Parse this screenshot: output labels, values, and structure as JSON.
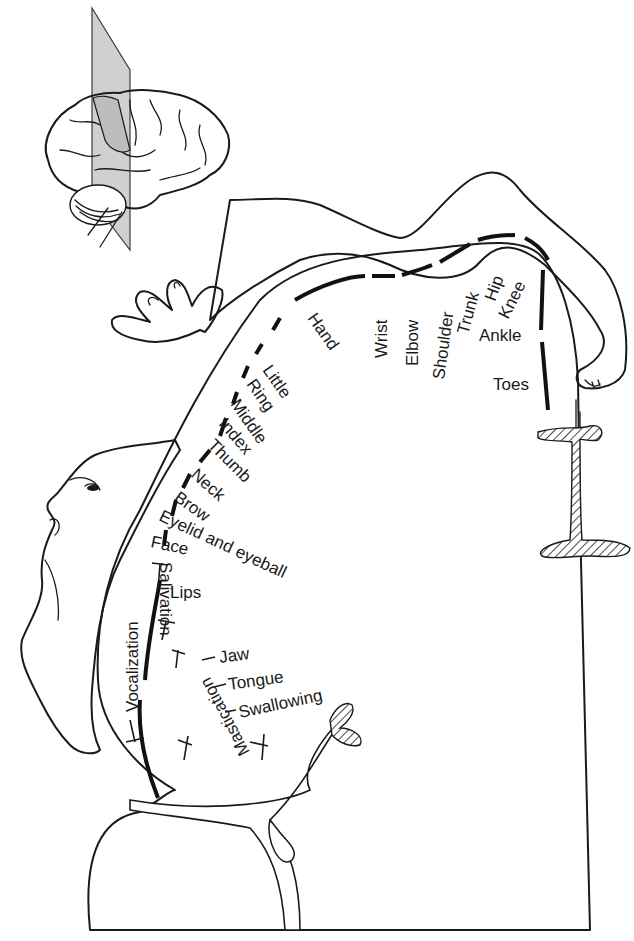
{
  "figure": {
    "colors": {
      "cortex_fill": "#e6e6e6",
      "body_fill": "#e2e2e2",
      "ink": "#1a1a1a",
      "plane": "#b5b5b5",
      "background": "#ffffff"
    },
    "inset": {
      "name": "brain-lateral-view-with-section-plane"
    },
    "labels": {
      "hand": "Hand",
      "wrist": "Wrist",
      "elbow": "Elbow",
      "shoulder": "Shoulder",
      "trunk": "Trunk",
      "hip": "Hip",
      "knee": "Knee",
      "ankle": "Ankle",
      "toes": "Toes",
      "little": "Little",
      "ring": "Ring",
      "middle": "Middle",
      "index": "Index",
      "thumb": "Thumb",
      "neck": "Neck",
      "brow": "Brow",
      "eyelid": "Eyelid and eyeball",
      "face": "Face",
      "lips": "Lips",
      "vocalization": "Vocalization",
      "salivation": "Salivation",
      "mastication": "Mastication",
      "jaw": "Jaw",
      "tongue": "Tongue",
      "swallowing": "Swallowing"
    }
  }
}
